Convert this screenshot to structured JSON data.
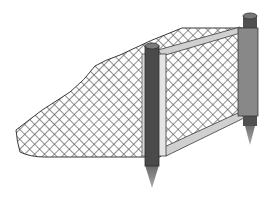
{
  "figure": {
    "description": "Illustration of a fish net / barrier net stretched on a frame between two stakes driven into the ground",
    "colors": {
      "background": "#ffffff",
      "net_mesh": "#555555",
      "net_outline": "#3a3a3a",
      "front_post": "#4a4a4a",
      "front_post_cap": "#7a7a7a",
      "back_post": "#888888",
      "back_post_dark": "#505050",
      "frame_bar": "#d0d0d0",
      "frame_outline": "#3a3a3a",
      "spike": "#8a8a8a"
    }
  }
}
